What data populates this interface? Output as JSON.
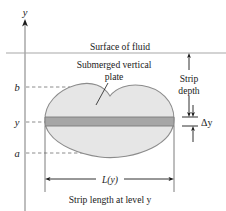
{
  "figure": {
    "type": "diagram",
    "background_color": "#ffffff",
    "ink_color": "#1a1a1a",
    "plate_fill_color": "#e6e6e6",
    "plate_stroke_color": "#8c8c8c",
    "strip_fill_color": "#a6a6a6",
    "strip_stroke_color": "#7a7a7a",
    "dashed_color": "#8c8c8c"
  },
  "axis": {
    "label": "y",
    "orientation": "vertical",
    "arrow": "up",
    "x_px": 25,
    "top_px": 22,
    "bottom_px": 211
  },
  "surface": {
    "label": "Surface of fluid",
    "line_y_px": 53,
    "label_x_px": 120,
    "label_y_px": 48
  },
  "plate": {
    "label_line_1": "Submerged vertical",
    "label_line_2": "plate",
    "label_x_px": 114,
    "label_line_1_y_px": 65,
    "label_line_2_y_px": 77,
    "leader_from_px": [
      108,
      80
    ],
    "leader_to_px": [
      96,
      104
    ]
  },
  "tick_labels": [
    {
      "name": "b",
      "text": "b",
      "y_px": 87,
      "dash_to_x_px": 70
    },
    {
      "name": "y",
      "text": "y",
      "y_px": 122,
      "dash_to_x_px": 50
    },
    {
      "name": "a",
      "text": "a",
      "y_px": 153,
      "dash_to_x_px": 95
    }
  ],
  "strip": {
    "top_y_px": 117,
    "bottom_y_px": 126,
    "left_x_px": 45,
    "right_x_px": 174
  },
  "strip_depth": {
    "label_line_1": "Strip",
    "label_line_2": "depth",
    "label_x_px": 189,
    "label_line_1_y_px": 79,
    "label_line_2_y_px": 91,
    "arrow_x_px": 189,
    "arrow_top_y_px": 53,
    "arrow_bottom_y_px": 117
  },
  "delta_y": {
    "label": "Δy",
    "label_x_px": 207,
    "label_y_px": 125,
    "arrow_x_px": 193,
    "top_y_px": 108,
    "bottom_y_px": 140,
    "band_top_y_px": 117,
    "band_bottom_y_px": 126
  },
  "length_measure": {
    "label": "L(y)",
    "label_x_px": 110,
    "label_y_px": 182,
    "arrow_y_px": 179,
    "left_x_px": 45,
    "right_x_px": 174,
    "drop_line_top_y_px": 126,
    "drop_line_bottom_y_px": 192
  },
  "caption": {
    "text": "Strip length at level y",
    "x_px": 110,
    "y_px": 200
  }
}
